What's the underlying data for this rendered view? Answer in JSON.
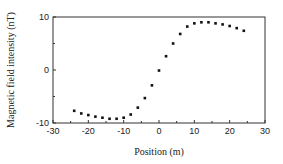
{
  "chart_data": {
    "type": "scatter",
    "title": "",
    "xlabel": "Position (m)",
    "ylabel": "Magnetic field intensity (nT)",
    "xlim": [
      -30,
      30
    ],
    "ylim": [
      -10,
      10
    ],
    "xticks": [
      -30,
      -20,
      -10,
      0,
      10,
      20,
      30
    ],
    "yticks": [
      -10,
      0,
      10
    ],
    "grid": false,
    "legend": null,
    "series": [
      {
        "name": "measurements",
        "marker": "square",
        "color": "#111111",
        "x": [
          -24,
          -22,
          -20,
          -18,
          -16,
          -14,
          -12,
          -10,
          -8,
          -6,
          -4,
          -2,
          0,
          2,
          4,
          6,
          8,
          10,
          12,
          14,
          16,
          18,
          20,
          22,
          24
        ],
        "y": [
          -7.7,
          -8.2,
          -8.5,
          -8.8,
          -9.0,
          -9.2,
          -9.2,
          -9.0,
          -8.4,
          -7.1,
          -5.3,
          -2.9,
          -0.1,
          2.6,
          5.0,
          6.8,
          8.2,
          8.8,
          9.0,
          9.0,
          8.8,
          8.6,
          8.3,
          7.9,
          7.4
        ]
      }
    ]
  }
}
